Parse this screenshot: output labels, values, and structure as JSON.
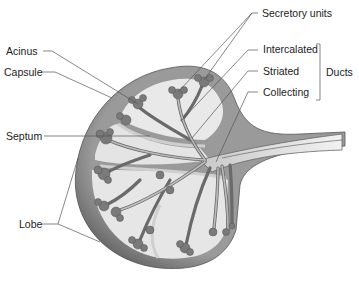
{
  "diagram": {
    "labels": {
      "acinus": "Acinus",
      "capsule": "Capsule",
      "septum": "Septum",
      "lobe": "Lobe",
      "secretory_units": "Secretory units",
      "intercalated": "Intercalated",
      "striated": "Striated",
      "collecting": "Collecting",
      "ducts": "Ducts"
    },
    "colors": {
      "capsule": "#6e6e6e",
      "capsule_light": "#a8a8a8",
      "lobe_fill": "#e6e6e6",
      "duct": "#bdbdbd",
      "acinus": "#7c7c7c",
      "leader_line": "#555555",
      "text": "#222222"
    }
  }
}
